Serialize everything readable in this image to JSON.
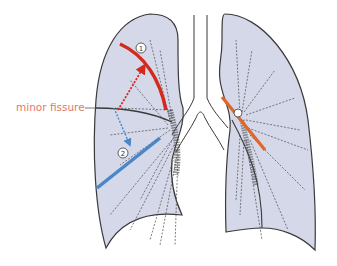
{
  "figure": {
    "labels": {
      "minor_fissure": "minor fissure",
      "marker_1": "1",
      "marker_2": "2"
    },
    "colors": {
      "lung_fill": "#d4d8e8",
      "outline": "#3a3a3a",
      "marker_1_line": "#d42a1e",
      "marker_2_line": "#4a86c8",
      "left_hilum_line": "#e0662a",
      "label_text": "#e07a6a"
    }
  }
}
